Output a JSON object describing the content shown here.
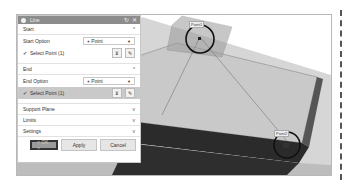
{
  "dialog": {
    "title": "Line",
    "title_buttons": [
      "↻",
      "✕"
    ],
    "sections": {
      "start": {
        "label": "Start",
        "chevron": "^",
        "option_label": "Start Option",
        "option_value": "+ Point",
        "select_label": "Select Point (1)"
      },
      "end": {
        "label": "End",
        "chevron": "^",
        "option_label": "End Option",
        "option_value": "+ Point",
        "select_label": "Select Point (1)"
      },
      "collapsed": [
        {
          "label": "Support Plane",
          "chevron": "v"
        },
        {
          "label": "Limits",
          "chevron": "v"
        },
        {
          "label": "Settings",
          "chevron": "v"
        }
      ]
    },
    "buttons": {
      "ok": "< OK >",
      "apply": "Apply",
      "cancel": "Cancel"
    }
  },
  "viewport": {
    "point_labels": [
      "Point1",
      "Point2"
    ]
  },
  "colors": {
    "titlebar": "#8c8c8c",
    "active_row": "#c9c9c9",
    "model_top": "#c4c4c4",
    "model_side": "#2b2b2b",
    "circle": "#111111"
  }
}
